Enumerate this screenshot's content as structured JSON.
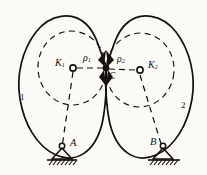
{
  "figure": {
    "style": {
      "ink": "#14110f",
      "paper": "#fbfaf7",
      "solid_stroke_width": 1.6,
      "dash_stroke_width": 1.1,
      "dash_pattern": "5,4"
    },
    "labels": {
      "k1": "K",
      "k1_sub": "1",
      "k2": "K",
      "k2_sub": "2",
      "rho1": "ρ",
      "rho1_sub": "1",
      "rho2": "ρ",
      "rho2_sub": "2",
      "contact": "C",
      "support_a": "A",
      "support_b": "B",
      "body1": "1",
      "body2": "2"
    },
    "points": {
      "contact_c": {
        "x": 106,
        "y": 68
      },
      "center_k1": {
        "x": 72,
        "y": 68
      },
      "center_k2": {
        "x": 140,
        "y": 70
      },
      "pivot_a": {
        "x": 62,
        "y": 150
      },
      "pivot_b": {
        "x": 163,
        "y": 150
      }
    },
    "geometry": {
      "curvature_circle_1_radius": 34,
      "curvature_circle_2_radius": 34,
      "body1_outline": "M106,68 C96,44 92,24 72,16 C50,7 26,26 21,62 C16,98 22,132 44,148 C66,164 92,146 101,112 C105,95 107,80 106,68 Z",
      "body2_outline": "M106,68 C116,44 120,24 140,16 C162,7 186,26 191,62 C196,98 190,132 168,148 C146,164 120,146 111,112 C107,95 105,80 106,68 Z"
    },
    "ground": {
      "hatch_count_a": 7,
      "hatch_count_b": 7,
      "baseline_a_y": 160,
      "baseline_b_y": 160
    }
  }
}
